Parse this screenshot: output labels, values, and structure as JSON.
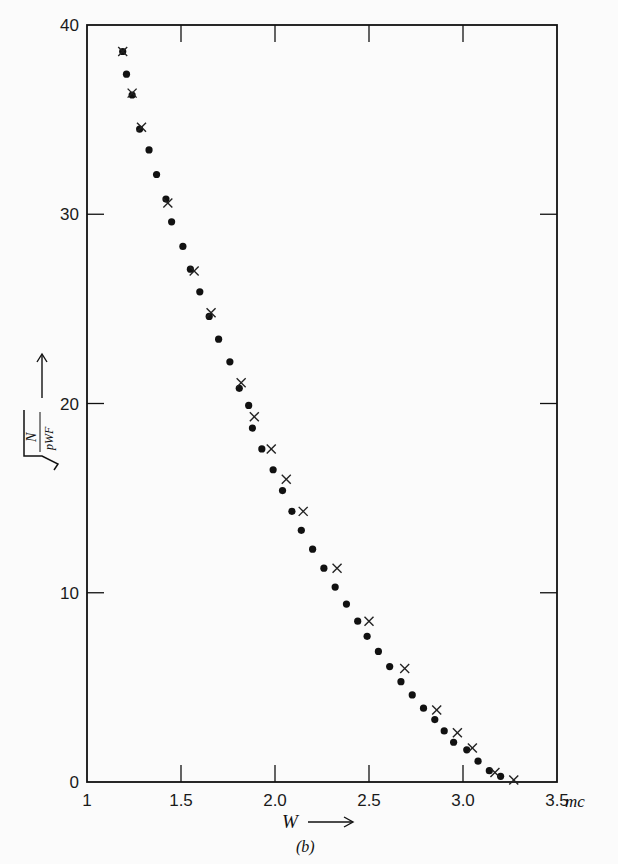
{
  "chart_data": {
    "type": "scatter",
    "title": "",
    "caption": "(b)",
    "xlabel": "W",
    "xunit": "mc",
    "ylabel": "sqrt(N / pWF)",
    "xlim": [
      1,
      3.5
    ],
    "ylim": [
      0,
      40
    ],
    "xticks": [
      "1",
      "1.5",
      "2.0",
      "2.5",
      "3.0",
      "3.5"
    ],
    "xtick_values": [
      1,
      1.5,
      2.0,
      2.5,
      3.0,
      3.5
    ],
    "yticks": [
      "0",
      "10",
      "20",
      "30",
      "40"
    ],
    "ytick_values": [
      0,
      10,
      20,
      30,
      40
    ],
    "grid": false,
    "series": [
      {
        "name": "dots",
        "marker": "circle",
        "x": [
          1.19,
          1.21,
          1.24,
          1.28,
          1.33,
          1.37,
          1.42,
          1.45,
          1.51,
          1.55,
          1.6,
          1.65,
          1.7,
          1.76,
          1.81,
          1.86,
          1.88,
          1.93,
          1.99,
          2.04,
          2.09,
          2.14,
          2.2,
          2.26,
          2.32,
          2.38,
          2.44,
          2.49,
          2.55,
          2.61,
          2.67,
          2.73,
          2.79,
          2.85,
          2.9,
          2.95,
          3.02,
          3.08,
          3.14,
          3.2
        ],
        "y": [
          38.6,
          37.4,
          36.3,
          34.5,
          33.4,
          32.1,
          30.8,
          29.6,
          28.3,
          27.1,
          25.9,
          24.6,
          23.4,
          22.2,
          20.8,
          19.9,
          18.7,
          17.6,
          16.5,
          15.4,
          14.3,
          13.3,
          12.3,
          11.3,
          10.3,
          9.4,
          8.5,
          7.7,
          6.9,
          6.1,
          5.3,
          4.6,
          3.9,
          3.3,
          2.7,
          2.1,
          1.7,
          1.1,
          0.6,
          0.3
        ]
      },
      {
        "name": "crosses",
        "marker": "x",
        "x": [
          1.19,
          1.24,
          1.29,
          1.43,
          1.57,
          1.66,
          1.82,
          1.89,
          1.98,
          2.06,
          2.15,
          2.33,
          2.5,
          2.69,
          2.86,
          2.97,
          3.05,
          3.17,
          3.27
        ],
        "y": [
          38.6,
          36.4,
          34.6,
          30.6,
          27.0,
          24.8,
          21.1,
          19.3,
          17.6,
          16.0,
          14.3,
          11.3,
          8.5,
          6.0,
          3.8,
          2.6,
          1.8,
          0.5,
          0.1
        ]
      }
    ]
  },
  "labels": {
    "xlabel": "W",
    "xunit": "mc",
    "caption": "(b)",
    "ylabel_num": "N",
    "ylabel_den": "pWF"
  }
}
